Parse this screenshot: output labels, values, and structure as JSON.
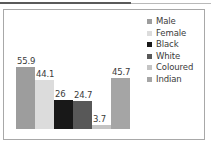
{
  "chart_data": {
    "type": "bar",
    "title": "",
    "subtitle": "",
    "xlabel": "",
    "ylabel": "",
    "categories": [
      "Male",
      "Female",
      "Black",
      "White",
      "Coloured",
      "Indian"
    ],
    "values": [
      55.9,
      44.1,
      26,
      24.7,
      3.7,
      45.7
    ],
    "value_labels": [
      "55.9",
      "44.1",
      "26",
      "24.7",
      "3.7",
      "45.7"
    ],
    "colors": [
      "#9d9d9d",
      "#dcdcdc",
      "#181818",
      "#585858",
      "#c4c4c4",
      "#a5a5a5"
    ],
    "ylim": [
      0,
      60
    ],
    "grid": false,
    "legend_position": "right",
    "legend": [
      {
        "label": "Male",
        "color": "#9d9d9d"
      },
      {
        "label": "Female",
        "color": "#dcdcdc"
      },
      {
        "label": "Black",
        "color": "#181818"
      },
      {
        "label": "White",
        "color": "#585858"
      },
      {
        "label": "Coloured",
        "color": "#c4c4c4"
      },
      {
        "label": "Indian",
        "color": "#a5a5a5"
      }
    ]
  },
  "frame": {
    "border_color": "#a8a8a8",
    "rule_color": "#5a5a5a"
  }
}
